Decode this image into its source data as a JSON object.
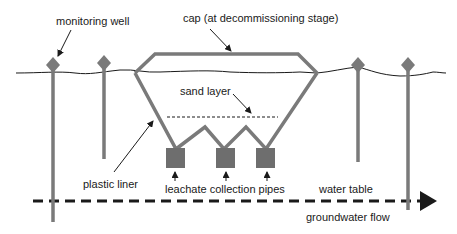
{
  "colors": {
    "structure": "#7a7a7a",
    "line": "#1a1a1a",
    "background": "#ffffff"
  },
  "labels": {
    "monitoring_well": "monitoring well",
    "cap": "cap (at decommissioning stage)",
    "sand_layer": "sand layer",
    "plastic_liner": "plastic liner",
    "leachate_pipes": "leachate collection pipes",
    "water_table": "water table",
    "groundwater_flow": "groundwater flow"
  },
  "components": {
    "monitoring_wells": 4,
    "leachate_pipes": 3
  },
  "icons": {
    "well_head": "diamond",
    "pipe": "square",
    "flow_arrow": "triangle-right"
  }
}
